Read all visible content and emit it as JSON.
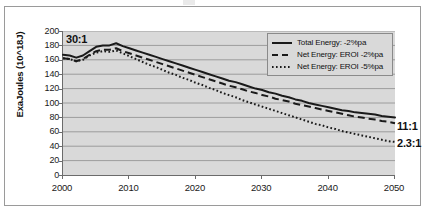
{
  "chart_data": {
    "type": "line",
    "title": "",
    "subtitle": "",
    "xlabel": "",
    "ylabel": "ExaJoules (10^18J)",
    "xlim": [
      2000,
      2050
    ],
    "ylim": [
      0,
      200
    ],
    "grid": true,
    "grid_axis": "y",
    "legend_position": "top-right",
    "y_ticks": [
      200,
      180,
      160,
      140,
      120,
      100,
      80,
      60,
      40,
      20,
      0
    ],
    "x_ticks": [
      2000,
      2010,
      2020,
      2030,
      2040,
      2050
    ],
    "x": [
      2000,
      2001,
      2002,
      2003,
      2004,
      2005,
      2006,
      2007,
      2008,
      2009,
      2010,
      2011,
      2012,
      2013,
      2014,
      2015,
      2016,
      2017,
      2018,
      2019,
      2020,
      2021,
      2022,
      2023,
      2024,
      2025,
      2026,
      2027,
      2028,
      2029,
      2030,
      2031,
      2032,
      2033,
      2034,
      2035,
      2036,
      2037,
      2038,
      2039,
      2040,
      2041,
      2042,
      2043,
      2044,
      2045,
      2046,
      2047,
      2048,
      2049,
      2050
    ],
    "series": [
      {
        "name": "Total Energy: -2%pa",
        "style": "solid",
        "color": "#1a1a1a",
        "values": [
          167,
          166,
          163,
          166,
          172,
          178,
          180,
          180,
          183,
          179,
          176,
          173,
          170,
          167,
          164,
          161,
          158,
          155,
          152,
          149,
          146,
          143,
          140,
          137,
          134,
          131,
          129,
          126,
          123,
          120,
          118,
          115,
          113,
          110,
          108,
          105,
          103,
          100,
          98,
          96,
          94,
          92,
          90,
          89,
          87,
          86,
          85,
          84,
          82,
          81,
          80
        ]
      },
      {
        "name": "Net Energy: EROI -2%pa",
        "style": "dashed",
        "color": "#1a1a1a",
        "values": [
          162,
          161,
          158,
          161,
          167,
          172,
          174,
          174,
          176,
          172,
          169,
          166,
          163,
          160,
          157,
          154,
          151,
          148,
          145,
          142,
          139,
          136,
          133,
          130,
          127,
          124,
          122,
          119,
          116,
          114,
          111,
          109,
          106,
          104,
          102,
          99,
          97,
          95,
          93,
          91,
          89,
          87,
          85,
          83,
          81,
          80,
          78,
          77,
          75,
          74,
          72
        ]
      },
      {
        "name": "Net Energy: EROI -5%pa",
        "style": "dotted",
        "color": "#1a1a1a",
        "values": [
          162,
          161,
          158,
          160,
          166,
          170,
          172,
          171,
          173,
          169,
          165,
          161,
          157,
          153,
          150,
          146,
          142,
          139,
          135,
          132,
          128,
          125,
          121,
          118,
          114,
          111,
          108,
          104,
          101,
          98,
          95,
          92,
          89,
          86,
          83,
          80,
          77,
          74,
          71,
          69,
          66,
          64,
          61,
          59,
          57,
          55,
          53,
          51,
          49,
          47,
          46
        ]
      }
    ],
    "annotations": [
      {
        "id": "start-ratio",
        "text": "30:1",
        "x": 2000,
        "y": 196,
        "anchor": "left"
      },
      {
        "id": "end-ratio-net2",
        "text": "11:1",
        "x": 2050,
        "y": 72,
        "anchor": "right"
      },
      {
        "id": "end-ratio-net5",
        "text": "2.3:1",
        "x": 2050,
        "y": 46,
        "anchor": "right"
      }
    ],
    "colors": {
      "plot_background": "#d9d9d9",
      "gridline": "#9c9c9c",
      "axis": "#6b6b6b",
      "series": "#1a1a1a",
      "figure_border": "#9a9a9a",
      "legend_background": "#d9d9d9",
      "legend_border": "#8a8a8a"
    }
  }
}
